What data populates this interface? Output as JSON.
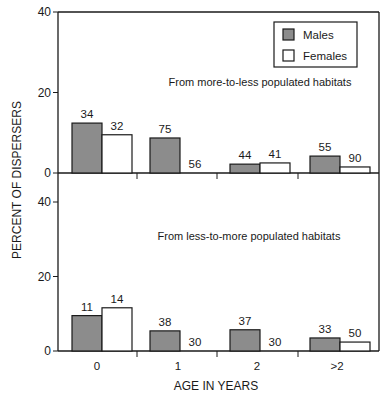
{
  "chart_data": {
    "type": "bar",
    "ylabel": "PERCENT OF DISPERSERS",
    "xlabel": "AGE IN YEARS",
    "categories": [
      "0",
      "1",
      "2",
      ">2"
    ],
    "legend": {
      "position": "top-right of upper panel",
      "entries": [
        "Males",
        "Females"
      ]
    },
    "colors": {
      "males": "#8c8c8c",
      "females": "#ffffff",
      "axis": "#1a1a1a"
    },
    "grid": false,
    "panels": [
      {
        "title": "From more-to-less populated habitats",
        "ylim": [
          0,
          40
        ],
        "yticks": [
          0,
          20,
          40
        ],
        "series": [
          {
            "name": "Males",
            "values": [
              12.4,
              8.7,
              2.2,
              4.2
            ],
            "labels": [
              "34",
              "75",
              "44",
              "55"
            ]
          },
          {
            "name": "Females",
            "values": [
              9.5,
              0,
              2.5,
              1.5
            ],
            "labels": [
              "32",
              "56",
              "41",
              "90"
            ]
          }
        ]
      },
      {
        "title": "From less-to-more populated habitats",
        "ylim": [
          0,
          40
        ],
        "yticks": [
          0,
          20,
          40
        ],
        "series": [
          {
            "name": "Males",
            "values": [
              9.5,
              5.4,
              5.7,
              3.5
            ],
            "labels": [
              "11",
              "38",
              "37",
              "33"
            ]
          },
          {
            "name": "Females",
            "values": [
              11.6,
              0,
              0,
              2.4
            ],
            "labels": [
              "14",
              "30",
              "30",
              "50"
            ]
          }
        ]
      }
    ]
  }
}
